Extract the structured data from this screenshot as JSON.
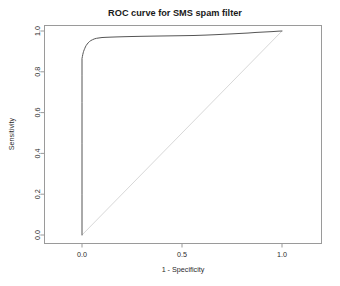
{
  "chart_data": {
    "type": "line",
    "title": "ROC curve for SMS spam filter",
    "xlabel": "1 - Specificity",
    "ylabel": "Sensitivity",
    "xlim": [
      -0.05,
      1.2
    ],
    "ylim": [
      -0.05,
      1.05
    ],
    "grid": false,
    "legend": null,
    "xticks": [
      0.0,
      0.5,
      1.0
    ],
    "xtick_labels": [
      "0.0",
      "0.5",
      "1.0"
    ],
    "yticks": [
      0.0,
      0.2,
      0.4,
      0.6,
      0.8,
      1.0
    ],
    "ytick_labels": [
      "0.0",
      "0.2",
      "0.4",
      "0.6",
      "0.8",
      "1.0"
    ],
    "series": [
      {
        "name": "ROC curve",
        "color": "#555555",
        "x": [
          0.0,
          0.0,
          0.0,
          0.0,
          0.0,
          0.0,
          0.002,
          0.004,
          0.006,
          0.008,
          0.011,
          0.014,
          0.017,
          0.021,
          0.026,
          0.031,
          0.037,
          0.044,
          0.052,
          0.061,
          0.072,
          0.085,
          0.1,
          0.12,
          0.145,
          0.175,
          0.21,
          0.25,
          0.3,
          0.36,
          0.43,
          0.5,
          0.56,
          0.62,
          0.67,
          0.71,
          0.75,
          0.79,
          0.83,
          0.87,
          0.91,
          0.95,
          0.98,
          1.0
        ],
        "y": [
          0.0,
          0.2,
          0.45,
          0.65,
          0.78,
          0.865,
          0.875,
          0.885,
          0.893,
          0.9,
          0.908,
          0.915,
          0.922,
          0.929,
          0.936,
          0.942,
          0.948,
          0.953,
          0.957,
          0.961,
          0.964,
          0.966,
          0.968,
          0.969,
          0.97,
          0.971,
          0.972,
          0.973,
          0.974,
          0.975,
          0.976,
          0.977,
          0.978,
          0.98,
          0.982,
          0.984,
          0.986,
          0.988,
          0.99,
          0.993,
          0.995,
          0.997,
          0.999,
          1.0
        ]
      },
      {
        "name": "chance diagonal",
        "color": "#d8d8d8",
        "x": [
          0.0,
          1.0
        ],
        "y": [
          0.0,
          1.0
        ]
      }
    ]
  }
}
